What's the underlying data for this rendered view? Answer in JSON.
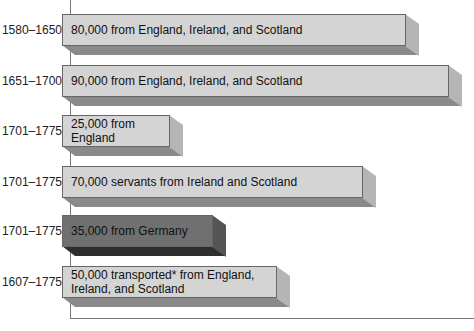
{
  "chart_data": {
    "type": "bar",
    "orientation": "horizontal",
    "title": "",
    "xlabel": "",
    "ylabel": "",
    "grid": false,
    "legend": null,
    "style": "3d-bar",
    "categories": [
      "1580–1650",
      "1651–1700",
      "1701–1775",
      "1701–1775",
      "1701–1775",
      "1607–1775"
    ],
    "values": [
      80000,
      90000,
      25000,
      70000,
      35000,
      50000
    ],
    "bar_labels": [
      "80,000 from England, Ireland, and Scotland",
      "90,000 from England, Ireland, and Scotland",
      "25,000 from England",
      "70,000 servants from Ireland and Scotland",
      "35,000 from Germany",
      "50,000 transported* from England, Ireland, and Scotland"
    ],
    "bar_colors": [
      "#d4d4d4",
      "#d4d4d4",
      "#d4d4d4",
      "#d4d4d4",
      "#6f6f6f",
      "#d4d4d4"
    ]
  },
  "rows": [
    {
      "period": "1580–1650",
      "label": "80,000 from England, Ireland, and Scotland",
      "value": 80000,
      "dark": false
    },
    {
      "period": "1651–1700",
      "label": "90,000 from England, Ireland, and Scotland",
      "value": 90000,
      "dark": false
    },
    {
      "period": "1701–1775",
      "label": "25,000 from England",
      "value": 25000,
      "dark": false
    },
    {
      "period": "1701–1775",
      "label": "70,000 servants from Ireland and Scotland",
      "value": 70000,
      "dark": false
    },
    {
      "period": "1701–1775",
      "label": "35,000 from Germany",
      "value": 35000,
      "dark": true
    },
    {
      "period": "1607–1775",
      "label": "50,000 transported* from England, Ireland, and Scotland",
      "value": 50000,
      "dark": false
    }
  ],
  "colors": {
    "light_front": "#d4d4d4",
    "light_bottom": "#8a8a8a",
    "light_side": "#b5b5b5",
    "dark_front": "#707070",
    "dark_bottom": "#2e2e2e",
    "dark_side": "#555555",
    "axis": "#777777"
  }
}
